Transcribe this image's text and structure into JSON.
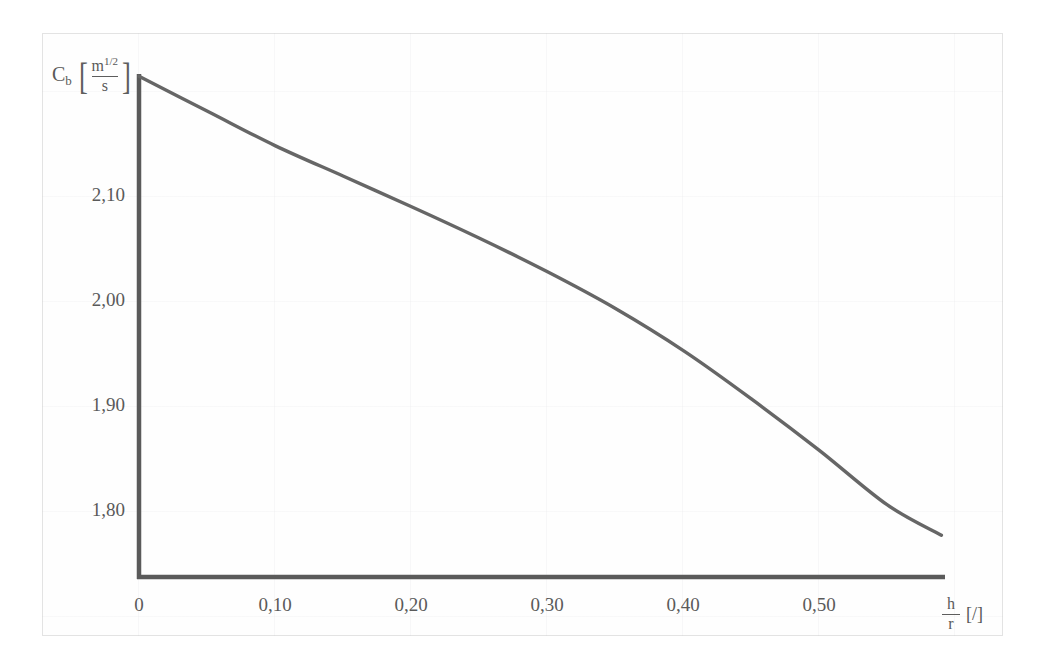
{
  "figure": {
    "background_color": "#ffffff",
    "frame_color": "#e3e3e3",
    "axis_color": "#5a5a5a",
    "curve_color": "#666666"
  },
  "axes": {
    "y_title": {
      "symbol": "C",
      "subscript": "b",
      "bracket_open": "[",
      "bracket_close": "]",
      "unit_numerator": "m",
      "unit_numerator_exponent": "1/2",
      "unit_denominator": "s"
    },
    "x_title": {
      "numerator": "h",
      "denominator": "r",
      "unit": "[/]"
    }
  },
  "chart_data": {
    "type": "line",
    "title": "",
    "subtitle": "",
    "xlabel": "h/r [/]",
    "ylabel": "Cb [m^(1/2)/s]",
    "xlim": [
      0.0,
      0.6
    ],
    "ylim": [
      1.74,
      2.22
    ],
    "grid": false,
    "legend": null,
    "xticks": [
      0.0,
      0.1,
      0.2,
      0.3,
      0.4,
      0.5
    ],
    "xticklabels": [
      "0",
      "0,10",
      "0,20",
      "0,30",
      "0,40",
      "0,50"
    ],
    "yticks": [
      2.1,
      2.0,
      1.9,
      1.8
    ],
    "yticklabels": [
      "2,10",
      "2,00",
      "1,90",
      "1,80"
    ],
    "series": [
      {
        "name": "Cb",
        "x": [
          0.0,
          0.05,
          0.1,
          0.15,
          0.2,
          0.25,
          0.3,
          0.35,
          0.4,
          0.45,
          0.5,
          0.55,
          0.59
        ],
        "y": [
          2.214,
          2.181,
          2.148,
          2.119,
          2.09,
          2.06,
          2.028,
          1.993,
          1.953,
          1.907,
          1.858,
          1.806,
          1.777
        ]
      }
    ],
    "annotations": []
  }
}
